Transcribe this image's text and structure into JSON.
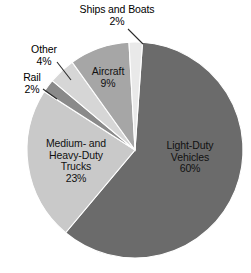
{
  "chart_data": {
    "type": "pie",
    "title": "",
    "subtitle": "",
    "xlabel": "",
    "ylabel": "",
    "legend_position": "none",
    "grid": false,
    "units": "percent",
    "total": 100,
    "categories": [
      "Light-Duty Vehicles",
      "Medium- and Heavy-Duty Trucks",
      "Rail",
      "Other",
      "Aircraft",
      "Ships and Boats"
    ],
    "values": [
      60,
      23,
      2,
      4,
      9,
      2
    ],
    "slices": [
      {
        "id": "light-duty-vehicles",
        "label": "Light-Duty Vehicles",
        "label_line1": "Light-Duty",
        "label_line2": "Vehicles",
        "value": 60,
        "percent_text": "60%",
        "color": "#6b6b6b",
        "label_placement": "inside"
      },
      {
        "id": "medium-heavy-duty-trucks",
        "label": "Medium- and Heavy-Duty Trucks",
        "label_line1": "Medium- and",
        "label_line2": "Heavy-Duty",
        "label_line3": "Trucks",
        "value": 23,
        "percent_text": "23%",
        "color": "#c9c9c9",
        "label_placement": "inside"
      },
      {
        "id": "rail",
        "label": "Rail",
        "label_line1": "Rail",
        "value": 2,
        "percent_text": "2%",
        "color": "#8a8a8a",
        "label_placement": "outside"
      },
      {
        "id": "other",
        "label": "Other",
        "label_line1": "Other",
        "value": 4,
        "percent_text": "4%",
        "color": "#d6d6d6",
        "label_placement": "outside"
      },
      {
        "id": "aircraft",
        "label": "Aircraft",
        "label_line1": "Aircraft",
        "value": 9,
        "percent_text": "9%",
        "color": "#a6a6a6",
        "label_placement": "inside"
      },
      {
        "id": "ships-and-boats",
        "label": "Ships and Boats",
        "label_line1": "Ships and Boats",
        "value": 2,
        "percent_text": "2%",
        "color": "#e9e9e9",
        "label_placement": "outside"
      }
    ]
  },
  "colors": {
    "background": "#ffffff",
    "slice_border": "#ffffff",
    "text": "#000000",
    "leader_line": "#2b2b2b"
  }
}
